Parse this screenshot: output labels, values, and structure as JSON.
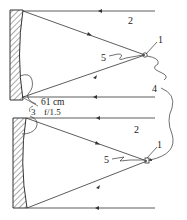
{
  "diagram": {
    "colors": {
      "line": "#333333",
      "hatch": "#444444",
      "background": "#ffffff"
    },
    "top_system": {
      "labels": {
        "focus": "1",
        "incoming_beam": "2",
        "detector_lead": "5",
        "link": "4"
      }
    },
    "bottom_system": {
      "labels": {
        "focus": "1",
        "incoming_beam": "2",
        "detector_lead": "5"
      }
    },
    "shared_labels": {
      "distance": "61 cm",
      "mirror_id": "3",
      "f_number": "f/1.5"
    }
  }
}
